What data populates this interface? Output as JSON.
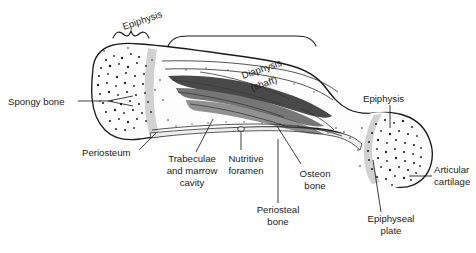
{
  "figure": {
    "background_color": "#ffffff",
    "ink_color": "#1b1b1b",
    "plate_color": "#c9c9c9",
    "periosteum_color": "#ededed"
  },
  "labels": {
    "epiphysis_left": "Epiphysis",
    "diaphysis_line1": "Diaphysis",
    "diaphysis_line2": "(shaft)",
    "epiphysis_right": "Epiphysis",
    "spongy_bone": "Spongy bone",
    "periosteum": "Periosteum",
    "trabeculae_line1": "Trabeculae",
    "trabeculae_line2": "and marrow",
    "trabeculae_line3": "cavity",
    "nutritive_line1": "Nutritive",
    "nutritive_line2": "foramen",
    "osteon_line1": "Osteon",
    "osteon_line2": "bone",
    "periosteal_line1": "Periosteal",
    "periosteal_line2": "bone",
    "epiphyseal_line1": "Epiphyseal",
    "epiphyseal_line2": "plate",
    "articular_line1": "Articular",
    "articular_line2": "cartilage"
  },
  "structures": [
    {
      "name": "epiphysis-left",
      "description": "Left expanded end of the long bone containing spongy bone"
    },
    {
      "name": "diaphysis",
      "description": "Central tubular shaft of the long bone"
    },
    {
      "name": "epiphysis-right",
      "description": "Right rounded end of the long bone"
    },
    {
      "name": "spongy-bone",
      "description": "Trabecular speckled bone tissue inside epiphyses"
    },
    {
      "name": "periosteum",
      "description": "Outer fibrous membrane covering the bone shaft"
    },
    {
      "name": "marrow-cavity",
      "description": "Dark medullary cavity running through the diaphysis"
    },
    {
      "name": "nutritive-foramen",
      "description": "Small opening on the shaft surface for blood vessels"
    },
    {
      "name": "osteon-bone",
      "description": "Compact bone composed of osteons in the shaft wall"
    },
    {
      "name": "periosteal-bone",
      "description": "Bone laid down beneath the periosteum"
    },
    {
      "name": "epiphyseal-plate",
      "description": "Light grey growth plate band between epiphysis and diaphysis"
    },
    {
      "name": "articular-cartilage",
      "description": "Cartilage capping the articular surface of the epiphysis"
    }
  ]
}
